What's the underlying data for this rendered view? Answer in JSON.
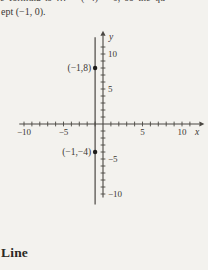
{
  "page": {
    "background": "#f3f2ee",
    "ink": "#3b3834",
    "axis_color": "#4a4742",
    "dot_color": "#1e1c1a"
  },
  "text": {
    "clipped_fragment": "e formula is … = (−4) = 0, so the qu",
    "intercept_line": "ept (−1, 0).",
    "section_heading": "Line"
  },
  "chart_data": {
    "type": "scatter",
    "title": "",
    "xlabel": "x",
    "ylabel": "y",
    "xlim": [
      -10,
      10
    ],
    "ylim": [
      -10,
      10
    ],
    "tick_step": 1,
    "grid": false,
    "x_ticks": [
      {
        "value": -10,
        "text": "−10"
      },
      {
        "value": -5,
        "text": "−5"
      },
      {
        "value": 5,
        "text": "5"
      },
      {
        "value": 10,
        "text": "10"
      }
    ],
    "y_ticks": [
      {
        "value": 10,
        "text": "10"
      },
      {
        "value": 5,
        "text": "5"
      },
      {
        "value": -5,
        "text": "−5"
      },
      {
        "value": -10,
        "text": "−10"
      }
    ],
    "points": [
      {
        "x": -1,
        "y": 8,
        "label": "(−1,8)"
      },
      {
        "x": -1,
        "y": -4,
        "label": "(−1,−4)"
      }
    ],
    "line": {
      "orientation": "vertical",
      "x": -1,
      "y_span": [
        -11.5,
        12.4
      ]
    }
  }
}
